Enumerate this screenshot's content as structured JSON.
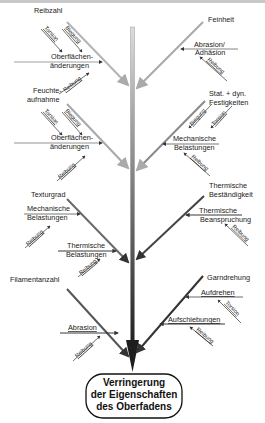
{
  "diagram": {
    "type": "fishbone",
    "effect": {
      "line1": "Verringerung",
      "line2": "der Eigenschaften",
      "line3": "des Oberfadens"
    },
    "left_causes": [
      {
        "label": "Reibzahl",
        "sub": {
          "line1": "Oberflächen-",
          "line2": "änderungen",
          "factors": [
            "Torsion",
            "Biegung"
          ]
        },
        "factor": "Reibung"
      },
      {
        "label_line1": "Feuchte-",
        "label_line2": "aufnahme",
        "sub": {
          "line1": "Oberflächen-",
          "line2": "änderungen",
          "factors": [
            "Torsion",
            "Biegung"
          ]
        },
        "factor": "Reibung"
      },
      {
        "label": "Texturgrad",
        "subs": [
          {
            "line1": "Mechanische",
            "line2": "Belastungen",
            "factor": "Reibung"
          },
          {
            "line1": "Thermische",
            "line2": "Belastungen",
            "factor": "Reibung"
          }
        ]
      },
      {
        "label": "Filamentanzahl",
        "sub": {
          "line1": "Abrasion",
          "factor": "Reibung"
        }
      }
    ],
    "right_causes": [
      {
        "label": "Feinheit",
        "sub": {
          "line1": "Abrasion/",
          "line2": "Adhäsion",
          "factor": "Reibung"
        }
      },
      {
        "label_line1": "Stat. + dyn.",
        "label_line2": "Festigkeiten",
        "sub": {
          "line1": "Mechanische",
          "line2": "Belastungen",
          "factors": [
            "Biegung",
            "Torsion"
          ],
          "factor": "Reibung"
        }
      },
      {
        "label_line1": "Thermische",
        "label_line2": "Beständigkeit",
        "sub": {
          "line1": "Thermische",
          "line2": "Beanspruchung",
          "factor": "Reibung"
        }
      },
      {
        "label": "Garndrehung",
        "subs": [
          {
            "line1": "Aufdrehen",
            "factor": "Torsion"
          },
          {
            "line1": "Aufschiebungen",
            "factor": "Reibung"
          }
        ]
      }
    ],
    "colors": {
      "spine_top": "#d0d0d0",
      "spine_bottom": "#222222",
      "text": "#222222",
      "box_border": "#111111"
    }
  }
}
